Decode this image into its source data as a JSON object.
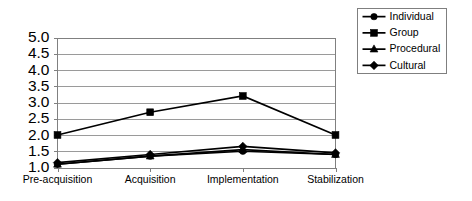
{
  "chart_data": {
    "type": "line",
    "title": "",
    "xlabel": "",
    "ylabel": "",
    "categories": [
      "Pre-acquisition",
      "Acquisition",
      "Implementation",
      "Stabilization"
    ],
    "series": [
      {
        "name": "Individual",
        "marker": "circle",
        "values": [
          1.1,
          1.35,
          1.5,
          1.4
        ]
      },
      {
        "name": "Group",
        "marker": "square",
        "values": [
          2.0,
          2.7,
          3.2,
          2.0
        ]
      },
      {
        "name": "Procedural",
        "marker": "triangle",
        "values": [
          1.1,
          1.35,
          1.55,
          1.4
        ]
      },
      {
        "name": "Cultural",
        "marker": "diamond",
        "values": [
          1.15,
          1.4,
          1.65,
          1.45
        ]
      }
    ],
    "ylim": [
      1.0,
      5.0
    ],
    "ytick_labels": [
      "5.0",
      "4.5",
      "4.0",
      "3.5",
      "3.0",
      "2.5",
      "2.0",
      "1.5",
      "1.0"
    ],
    "ytick_values": [
      5.0,
      4.5,
      4.0,
      3.5,
      3.0,
      2.5,
      2.0,
      1.5,
      1.0
    ],
    "grid": true,
    "legend_position": "right",
    "colors": {
      "series": "#000000",
      "grid": "#9a9a9a",
      "axis": "#808080",
      "background": "#ffffff"
    }
  }
}
